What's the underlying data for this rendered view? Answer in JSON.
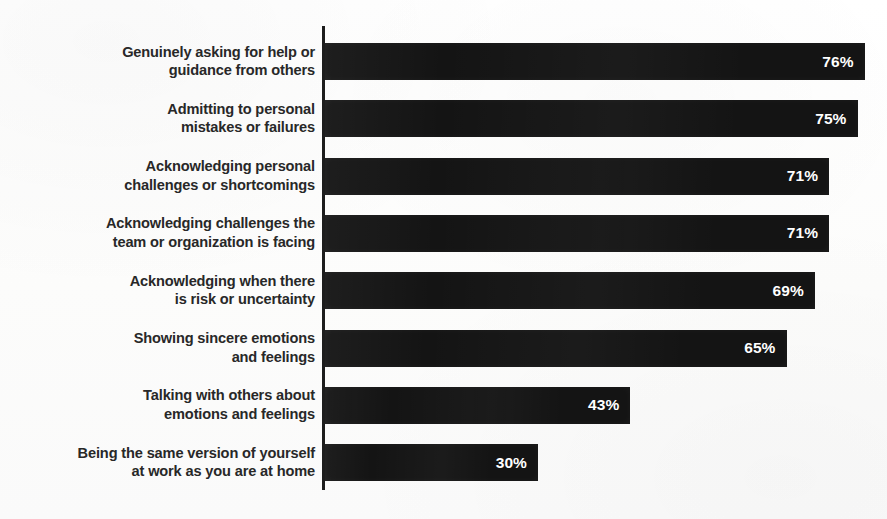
{
  "chart_data": {
    "type": "bar",
    "orientation": "horizontal",
    "title": "",
    "subtitle": "",
    "xlabel": "",
    "ylabel": "",
    "xlim": [
      0,
      80
    ],
    "grid": false,
    "legend": null,
    "value_suffix": "%",
    "categories": [
      "Genuinely asking for help or\nguidance from others",
      "Admitting to personal\nmistakes or failures",
      "Acknowledging personal\nchallenges or shortcomings",
      "Acknowledging challenges the\nteam or organization is facing",
      "Acknowledging when there\nis risk or uncertainty",
      "Showing sincere emotions\nand feelings",
      "Talking with others about\nemotions and feelings",
      "Being the same version of yourself\nat work as you are at home"
    ],
    "values": [
      76,
      75,
      71,
      71,
      69,
      65,
      43,
      30
    ],
    "value_labels": [
      "76%",
      "75%",
      "71%",
      "71%",
      "69%",
      "65%",
      "43%",
      "30%"
    ],
    "colors": {
      "bar": "#141414",
      "axis": "#1d1d1d",
      "label_text": "#282828",
      "value_text": "#ffffff",
      "background": "#fdfdfd"
    },
    "bars": [
      {
        "label": "Genuinely asking for help or\nguidance from others",
        "value": 76,
        "value_label": "76%"
      },
      {
        "label": "Admitting to personal\nmistakes or failures",
        "value": 75,
        "value_label": "75%"
      },
      {
        "label": "Acknowledging personal\nchallenges or shortcomings",
        "value": 71,
        "value_label": "71%"
      },
      {
        "label": "Acknowledging challenges the\nteam or organization is facing",
        "value": 71,
        "value_label": "71%"
      },
      {
        "label": "Acknowledging when there\nis risk or uncertainty",
        "value": 69,
        "value_label": "69%"
      },
      {
        "label": "Showing sincere emotions\nand feelings",
        "value": 65,
        "value_label": "65%"
      },
      {
        "label": "Talking with others about\nemotions and feelings",
        "value": 43,
        "value_label": "43%"
      },
      {
        "label": "Being the same version of yourself\nat work as you are at home",
        "value": 30,
        "value_label": "30%"
      }
    ]
  },
  "layout": {
    "axis_x": 322,
    "axis_top": 26,
    "axis_height": 464,
    "bar_start_x": 325,
    "bar_height": 37,
    "row_pitch": 57.3,
    "first_row_top": 43,
    "px_per_unit": 7.1
  }
}
